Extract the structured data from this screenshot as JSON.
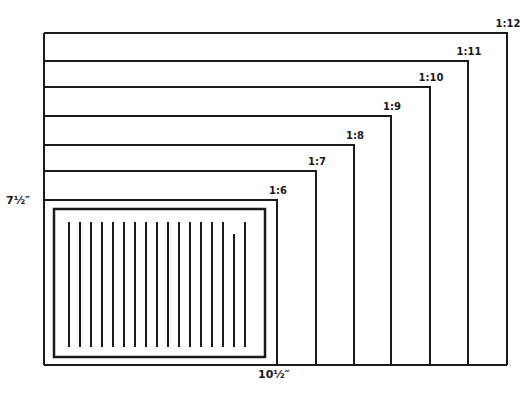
{
  "diagram": {
    "stroke_color": "#1a1a1a",
    "height_label": "7½″",
    "width_label": "10½″",
    "origin": {
      "left": 44,
      "bottom": 365
    },
    "frames": [
      {
        "ratio": "1:6",
        "right": 277,
        "top": 200
      },
      {
        "ratio": "1:7",
        "right": 316,
        "top": 171
      },
      {
        "ratio": "1:8",
        "right": 354,
        "top": 145
      },
      {
        "ratio": "1:9",
        "right": 391,
        "top": 116
      },
      {
        "ratio": "1:10",
        "right": 430,
        "top": 87
      },
      {
        "ratio": "1:11",
        "right": 468,
        "top": 61
      },
      {
        "ratio": "1:12",
        "right": 507,
        "top": 33
      }
    ],
    "page": {
      "rect": {
        "x": 54,
        "y": 209,
        "w": 211,
        "h": 148
      },
      "text_lines": {
        "count": 17,
        "x_start": 69,
        "x_end": 245,
        "y_top": 222,
        "y_bottom": 347,
        "short_line_index": 15,
        "short_line_top": 234
      }
    }
  }
}
